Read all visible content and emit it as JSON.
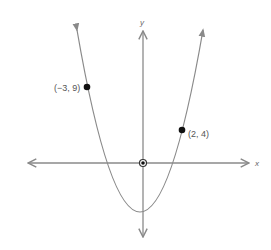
{
  "diagram": {
    "type": "parabola-graph",
    "axes": {
      "x_label": "x",
      "y_label": "y"
    },
    "points": [
      {
        "label": "(−3, 9)",
        "x": -3,
        "y": 9
      },
      {
        "label": "(2, 4)",
        "x": 2,
        "y": 4
      },
      {
        "label": "",
        "x": 0,
        "y": 0
      }
    ],
    "colors": {
      "line": "#8a8a8a",
      "point": "#111111",
      "text": "#555555",
      "background": "#ffffff"
    }
  }
}
